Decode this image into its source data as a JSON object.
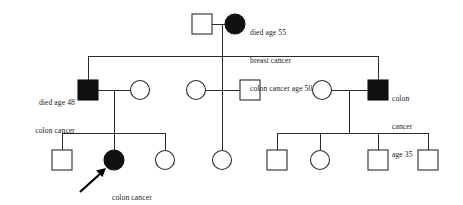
{
  "figure": {
    "type": "pedigree-chart",
    "background_color": "#ffffff",
    "line_color": "#2b2b2b",
    "affected_fill_color": "#111111",
    "unaffected_fill_color": "#ffffff"
  },
  "legend_semantics": {
    "square": "male",
    "circle": "female",
    "filled": "affected",
    "open": "unaffected",
    "arrow": "proband"
  },
  "annotations": {
    "founder_female": {
      "lines": [
        "died age 55",
        "breast cancer",
        "colon cancer age 50"
      ],
      "align": "left-of-text-block-right-of-symbol"
    },
    "gen2_male_left": {
      "lines": [
        "died age 48",
        "colon cancer"
      ],
      "align": "right"
    },
    "gen2_male_right": {
      "lines": [
        "colon",
        "cancer",
        "age 35"
      ],
      "align": "left"
    },
    "proband_female": {
      "lines": [
        "colon cancer",
        "age 36"
      ],
      "align": "left"
    }
  },
  "generations": [
    {
      "id": "generation-1",
      "label": "Generation I",
      "individuals": [
        {
          "id": "I-1",
          "sex": "male",
          "shape": "square",
          "affected": false,
          "x": 202,
          "y": 24
        },
        {
          "id": "I-2",
          "sex": "female",
          "shape": "circle",
          "affected": true,
          "x": 235,
          "y": 24,
          "annotation": "founder_female"
        }
      ]
    },
    {
      "id": "generation-2",
      "label": "Generation II",
      "individuals": [
        {
          "id": "II-1",
          "sex": "male",
          "shape": "square",
          "affected": true,
          "x": 88,
          "y": 90,
          "annotation": "gen2_male_left"
        },
        {
          "id": "II-2",
          "sex": "female",
          "shape": "circle",
          "affected": false,
          "x": 140,
          "y": 90,
          "spouse_of": "II-1"
        },
        {
          "id": "II-3",
          "sex": "female",
          "shape": "circle",
          "affected": false,
          "x": 196,
          "y": 90
        },
        {
          "id": "II-4",
          "sex": "male",
          "shape": "square",
          "affected": false,
          "x": 250,
          "y": 90,
          "spouse_of": "II-3"
        },
        {
          "id": "II-5",
          "sex": "female",
          "shape": "circle",
          "affected": false,
          "x": 322,
          "y": 90,
          "spouse_of": "II-6"
        },
        {
          "id": "II-6",
          "sex": "male",
          "shape": "square",
          "affected": true,
          "x": 378,
          "y": 90,
          "annotation": "gen2_male_right"
        }
      ]
    },
    {
      "id": "generation-3",
      "label": "Generation III",
      "individuals": [
        {
          "id": "III-1",
          "sex": "male",
          "shape": "square",
          "affected": false,
          "x": 62,
          "y": 160
        },
        {
          "id": "III-2",
          "sex": "female",
          "shape": "circle",
          "affected": true,
          "x": 114,
          "y": 160,
          "proband": true,
          "annotation": "proband_female"
        },
        {
          "id": "III-3",
          "sex": "female",
          "shape": "circle",
          "affected": false,
          "x": 165,
          "y": 160
        },
        {
          "id": "III-4",
          "sex": "female",
          "shape": "circle",
          "affected": false,
          "x": 222,
          "y": 160
        },
        {
          "id": "III-5",
          "sex": "male",
          "shape": "square",
          "affected": false,
          "x": 277,
          "y": 160
        },
        {
          "id": "III-6",
          "sex": "female",
          "shape": "circle",
          "affected": false,
          "x": 320,
          "y": 160
        },
        {
          "id": "III-7",
          "sex": "male",
          "shape": "square",
          "affected": false,
          "x": 378,
          "y": 160
        },
        {
          "id": "III-8",
          "sex": "male",
          "shape": "square",
          "affected": false,
          "x": 428,
          "y": 160
        }
      ]
    }
  ],
  "relationships": {
    "matings": [
      {
        "id": "mating-I",
        "partners": [
          "I-1",
          "I-2"
        ],
        "line_y": 24,
        "x1": 212,
        "x2": 226,
        "drop_x": 222
      },
      {
        "id": "mating-II-left",
        "partners": [
          "II-1",
          "II-2"
        ],
        "line_y": 90,
        "x1": 98,
        "x2": 131,
        "drop_x": 114
      },
      {
        "id": "mating-II-middle",
        "partners": [
          "II-3",
          "II-4"
        ],
        "line_y": 90,
        "x1": 205,
        "x2": 240,
        "drop_x": 222
      },
      {
        "id": "mating-II-right",
        "partners": [
          "II-5",
          "II-6"
        ],
        "line_y": 90,
        "x1": 331,
        "x2": 368,
        "drop_x": 349
      }
    ],
    "sibships": [
      {
        "id": "sibship-II",
        "parents": "mating-I",
        "bar_y": 56,
        "x_from": 88,
        "x_to": 378,
        "children_x": [
          88,
          222,
          378
        ]
      },
      {
        "id": "sibship-III-left",
        "parents": "mating-II-left",
        "bar_y": 133,
        "x_from": 62,
        "x_to": 165,
        "children_x": [
          62,
          114,
          165
        ]
      },
      {
        "id": "sibship-III-middle",
        "parents": "mating-II-middle",
        "bar_y": 133,
        "x_from": 222,
        "x_to": 222,
        "children_x": [
          222
        ]
      },
      {
        "id": "sibship-III-right",
        "parents": "mating-II-right",
        "bar_y": 133,
        "x_from": 277,
        "x_to": 428,
        "children_x": [
          277,
          320,
          378,
          428
        ]
      }
    ]
  },
  "proband_arrow": {
    "from_x": 80,
    "from_y": 192,
    "to_x": 104,
    "to_y": 170
  }
}
